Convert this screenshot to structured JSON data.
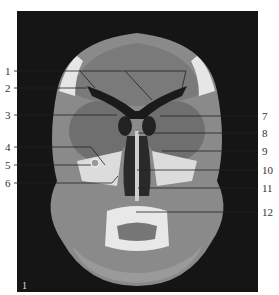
{
  "figure": {
    "type": "coronal CT scan of face / paranasal sinuses",
    "panel_label": "1",
    "left_labels": [
      {
        "num": "1",
        "y": 71
      },
      {
        "num": "2",
        "y": 88
      },
      {
        "num": "3",
        "y": 115
      },
      {
        "num": "4",
        "y": 147
      },
      {
        "num": "5",
        "y": 165
      },
      {
        "num": "6",
        "y": 183
      }
    ],
    "right_labels": [
      {
        "num": "7",
        "y": 116
      },
      {
        "num": "8",
        "y": 133
      },
      {
        "num": "9",
        "y": 151
      },
      {
        "num": "10",
        "y": 170
      },
      {
        "num": "11",
        "y": 188
      },
      {
        "num": "12",
        "y": 212
      }
    ]
  }
}
